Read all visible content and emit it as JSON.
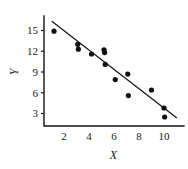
{
  "chart_data": {
    "type": "scatter",
    "title": "",
    "xlabel": "X",
    "ylabel": "Y",
    "xlim": [
      0.4,
      11.2
    ],
    "ylim": [
      1.2,
      16.8
    ],
    "grid": false,
    "legend": null,
    "xticks": [
      2,
      4,
      6,
      8,
      10
    ],
    "yticks": [
      3,
      6,
      9,
      12,
      15
    ],
    "xtick_labels": [
      "2",
      "4",
      "6",
      "8",
      "10"
    ],
    "ytick_labels": [
      "3",
      "6",
      "9",
      "12",
      "15"
    ],
    "points": [
      {
        "x": 1.2,
        "y": 14.9
      },
      {
        "x": 3.1,
        "y": 13.0
      },
      {
        "x": 3.15,
        "y": 12.3
      },
      {
        "x": 4.2,
        "y": 11.6
      },
      {
        "x": 5.2,
        "y": 12.2
      },
      {
        "x": 5.25,
        "y": 11.8
      },
      {
        "x": 5.3,
        "y": 10.1
      },
      {
        "x": 6.1,
        "y": 7.9
      },
      {
        "x": 7.1,
        "y": 8.7
      },
      {
        "x": 7.15,
        "y": 5.6
      },
      {
        "x": 9.0,
        "y": 6.4
      },
      {
        "x": 10.0,
        "y": 3.8
      },
      {
        "x": 10.05,
        "y": 2.5
      }
    ],
    "fit_line": {
      "label": "",
      "x_start": 1.05,
      "y_start": 16.3,
      "x_end": 11.0,
      "y_end": 2.4
    },
    "marker_radius_px": 2.6
  }
}
